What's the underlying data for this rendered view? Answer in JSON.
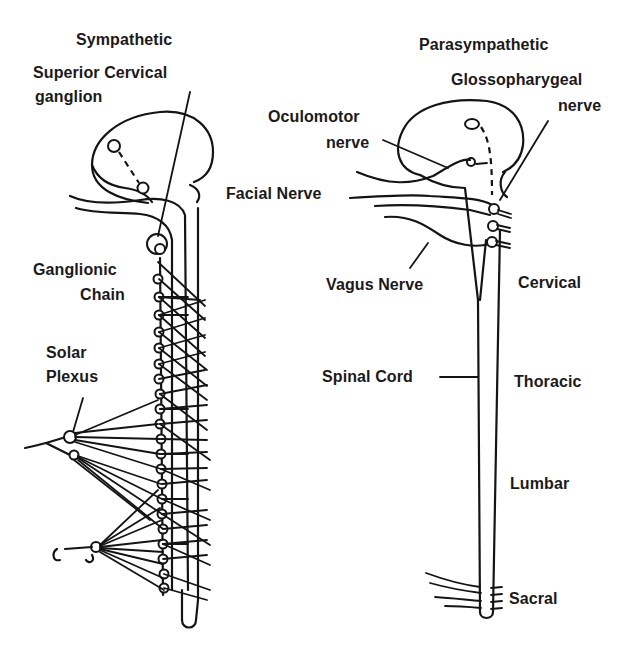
{
  "diagram": {
    "type": "autonomic-nervous-system",
    "sympathetic": {
      "title": "Sympathetic",
      "labels": {
        "superior_cervical_line1": "Superior Cervical",
        "superior_cervical_line2": "ganglion",
        "ganglionic_line1": "Ganglionic",
        "ganglionic_line2": "Chain",
        "solar_line1": "Solar",
        "solar_line2": "Plexus"
      }
    },
    "parasympathetic": {
      "title": "Parasympathetic",
      "labels": {
        "glosso_line1": "Glossopharygeal",
        "glosso_line2": "nerve",
        "oculomotor_line1": "Oculomotor",
        "oculomotor_line2": "nerve",
        "facial": "Facial Nerve",
        "vagus": "Vagus Nerve",
        "spinal_cord": "Spinal Cord"
      },
      "regions": [
        "Cervical",
        "Thoracic",
        "Lumbar",
        "Sacral"
      ]
    },
    "colors": {
      "ink": "#141414",
      "background": "#ffffff"
    }
  }
}
